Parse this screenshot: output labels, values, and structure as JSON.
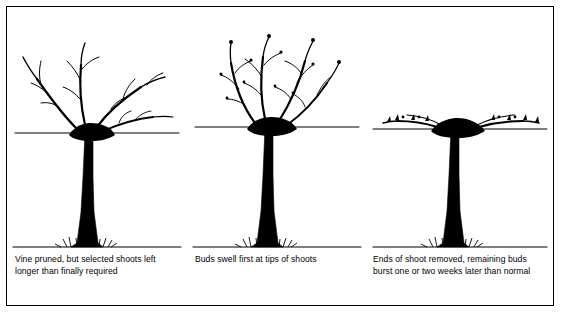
{
  "figure": {
    "border_color": "#000000",
    "background_color": "#ffffff",
    "ink_color": "#000000",
    "panel_count": 3
  },
  "panels": [
    {
      "id": "panel-1",
      "stage_number": 1,
      "caption": "Vine pruned, but selected shoots left longer than finally required",
      "elements": {
        "trunk": "thick-vertical-trunk",
        "head": "pruned-head-with-shoots",
        "wire": "horizontal-training-wire",
        "ground": "ground-line-with-grass",
        "shoot_count": 4,
        "shoot_state": "long-unpruned-canes"
      }
    },
    {
      "id": "panel-2",
      "stage_number": 2,
      "caption": "Buds swell first at tips of shoots",
      "elements": {
        "trunk": "thick-vertical-trunk",
        "head": "pruned-head-with-shoots",
        "wire": "horizontal-training-wire",
        "ground": "ground-line-with-grass",
        "shoot_count": 4,
        "shoot_state": "buds-swelling-at-tips"
      }
    },
    {
      "id": "panel-3",
      "stage_number": 3,
      "caption": "Ends of shoot removed, remaining buds burst one or two weeks later than normal",
      "elements": {
        "trunk": "thick-vertical-trunk",
        "head": "pruned-head-with-shoots",
        "wire": "horizontal-training-wire",
        "ground": "ground-line-with-grass",
        "shoot_count": 2,
        "shoot_state": "shortened-horizontal-canes-tied-to-wire"
      }
    }
  ]
}
